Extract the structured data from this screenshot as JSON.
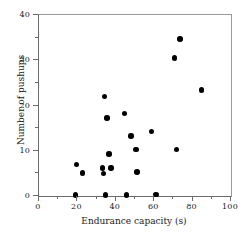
{
  "chart_data": {
    "type": "scatter",
    "title": "",
    "xlabel": "Endurance capacity (s)",
    "ylabel": "Number of pushups",
    "xlim": [
      0,
      100
    ],
    "ylim": [
      0,
      40
    ],
    "grid": false,
    "legend": null,
    "x_major_ticks": [
      0,
      20,
      40,
      60,
      80,
      100
    ],
    "x_minor_ticks": [
      10,
      30,
      50,
      70,
      90
    ],
    "y_major_ticks": [
      0,
      10,
      20,
      30,
      40
    ],
    "y_minor_ticks": [
      5,
      15,
      25,
      35
    ],
    "x_tick_labels": [
      "0",
      "20",
      "40",
      "60",
      "80",
      "100"
    ],
    "y_tick_labels": [
      "0",
      "10",
      "20",
      "30",
      "40"
    ],
    "marker": "filled-circle",
    "marker_color": "#000000",
    "points": [
      {
        "x": 19.0,
        "y": 0.2
      },
      {
        "x": 19.5,
        "y": 7.0
      },
      {
        "x": 22.5,
        "y": 5.1
      },
      {
        "x": 33.0,
        "y": 6.2
      },
      {
        "x": 33.5,
        "y": 5.0
      },
      {
        "x": 34.5,
        "y": 0.2
      },
      {
        "x": 34.0,
        "y": 22.0
      },
      {
        "x": 35.5,
        "y": 17.2
      },
      {
        "x": 36.5,
        "y": 9.3
      },
      {
        "x": 37.5,
        "y": 6.2
      },
      {
        "x": 44.5,
        "y": 18.3
      },
      {
        "x": 45.5,
        "y": 0.2
      },
      {
        "x": 48.0,
        "y": 13.3
      },
      {
        "x": 50.5,
        "y": 10.3
      },
      {
        "x": 51.0,
        "y": 5.3
      },
      {
        "x": 58.5,
        "y": 14.3
      },
      {
        "x": 61.0,
        "y": 0.3
      },
      {
        "x": 70.5,
        "y": 30.5
      },
      {
        "x": 71.5,
        "y": 10.3
      },
      {
        "x": 73.5,
        "y": 34.7
      },
      {
        "x": 84.5,
        "y": 23.4
      }
    ]
  }
}
